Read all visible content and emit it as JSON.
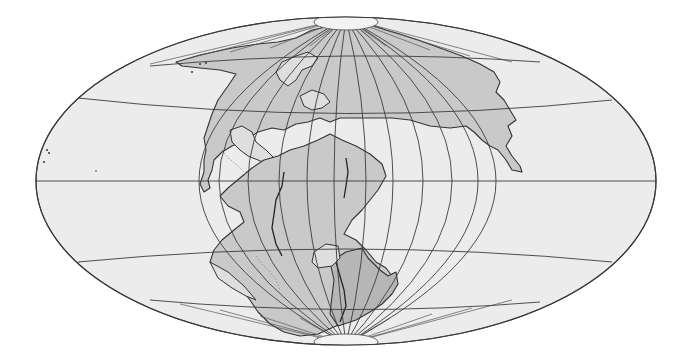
{
  "map": {
    "type": "paleogeographic world map",
    "projection": "oblique equal-area elliptical (Mollweide-style)",
    "subject": "Pangaea supercontinent",
    "labels": [],
    "colors": {
      "ocean": "#ececec",
      "land": "#c9c9c9",
      "land_shaded": "#b6b6b6",
      "polar_cap": "#f3f3f3",
      "graticule": "#3c3c3c",
      "background": "#ffffff"
    },
    "frame": {
      "center_x": 346,
      "center_y": 181,
      "radius_x": 310,
      "radius_y": 164
    },
    "graticule": {
      "meridian_count": 12,
      "parallels": [
        "60N",
        "30N",
        "Equator",
        "30S",
        "60S"
      ]
    },
    "regions": [
      {
        "name": "Laurasia",
        "hemisphere": "north"
      },
      {
        "name": "Gondwana",
        "hemisphere": "south"
      },
      {
        "name": "Tethys Sea",
        "type": "ocean"
      },
      {
        "name": "Panthalassa",
        "type": "ocean"
      }
    ]
  }
}
